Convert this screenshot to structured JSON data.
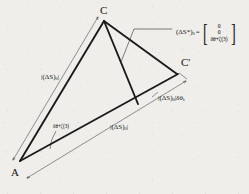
{
  "figure": {
    "type": "geometric-line-diagram",
    "background_color": "#efeeea",
    "ink_color": "#141414"
  },
  "vertices": [
    {
      "id": "C",
      "label": "C",
      "x": 103,
      "y": 14
    },
    {
      "id": "Cprime",
      "label": "C'",
      "x": 180,
      "y": 66
    },
    {
      "id": "A",
      "label": "A",
      "x": 14,
      "y": 166
    }
  ],
  "labels": {
    "side_left": {
      "text": "(ΔS)",
      "sub": "0",
      "bars": true
    },
    "bottom_mid": {
      "text": "(ΔS)",
      "sub": "0",
      "bars": true
    },
    "right_edge": {
      "text": "(ΔS)",
      "sub": "0",
      "bars": true,
      "suffix": "δθ",
      "suffix_sub": "λ"
    },
    "angle_arc": {
      "text": "δθ+ζ(3)"
    },
    "equation_lhs": {
      "text": "(ΔS*)",
      "sub": "0"
    },
    "equals": {
      "text": "="
    }
  },
  "matrix": {
    "rows": [
      "0",
      "0",
      "δθ+ζ(3)"
    ],
    "bracket_left": "[",
    "bracket_right": "]"
  },
  "geometry": {
    "thick_stroke": 1.9,
    "thin_stroke": 0.55,
    "edges": [
      {
        "name": "A-C",
        "from": [
          20,
          161
        ],
        "to": [
          104,
          21
        ],
        "weight": "thick"
      },
      {
        "name": "C-baseline",
        "from": [
          104,
          21
        ],
        "to": [
          138,
          104
        ],
        "weight": "thick"
      },
      {
        "name": "C-Cprime",
        "from": [
          104,
          21
        ],
        "to": [
          177,
          74
        ],
        "weight": "thick"
      },
      {
        "name": "A-Cprime",
        "from": [
          20,
          161
        ],
        "to": [
          177,
          74
        ],
        "weight": "thick"
      }
    ],
    "dimension_lines": [
      {
        "name": "left-dimension",
        "from": [
          13,
          160
        ],
        "to": [
          98,
          17
        ],
        "weight": "thin",
        "arrows": "both"
      },
      {
        "name": "bottom-dimension",
        "from": [
          27,
          178
        ],
        "to": [
          185,
          81
        ],
        "weight": "thin",
        "arrows": "both"
      }
    ],
    "angle_arc": {
      "center": [
        20,
        161
      ],
      "radius": 36,
      "start_deg": 300,
      "end_deg": 330
    },
    "leader_line": {
      "points": [
        [
          172,
          29
        ],
        [
          134,
          29
        ],
        [
          121,
          62
        ]
      ]
    }
  }
}
